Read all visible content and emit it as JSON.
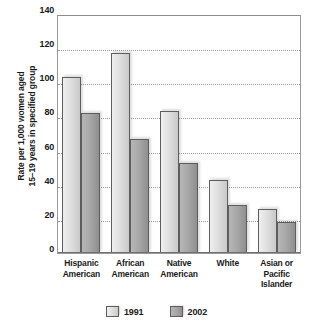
{
  "chart_data": {
    "type": "bar",
    "title": "",
    "xlabel": "",
    "ylabel": "Rate per 1,000 women aged 15–19 years in specified group",
    "ylabel_lines": [
      "Rate per 1,000 women aged",
      "15–19 years in specified group"
    ],
    "categories": [
      [
        "Hispanic",
        "American"
      ],
      [
        "African",
        "American"
      ],
      [
        "Native",
        "American"
      ],
      [
        "White"
      ],
      [
        "Asian or",
        "Pacific",
        "Islander"
      ]
    ],
    "category_names": [
      "Hispanic American",
      "African American",
      "Native American",
      "White",
      "Asian or Pacific Islander"
    ],
    "series": [
      {
        "name": "1991",
        "values": [
          103,
          117,
          83,
          43,
          26
        ],
        "color": "#e2e2e2"
      },
      {
        "name": "2002",
        "values": [
          82,
          67,
          53,
          28,
          18
        ],
        "color": "#a8a8a8"
      }
    ],
    "ylim": [
      0,
      140
    ],
    "ytick_values": [
      0,
      20,
      40,
      60,
      80,
      100,
      120,
      140
    ],
    "ytick_labels": [
      "0",
      "20",
      "40",
      "60",
      "80",
      "100",
      "120",
      "140"
    ],
    "grid": true,
    "grid_style": "dotted-horizontal",
    "legend_position": "bottom-center"
  },
  "legend": {
    "items": [
      {
        "label": "1991",
        "series_class": "series-1991"
      },
      {
        "label": "2002",
        "series_class": "series-2002"
      }
    ]
  }
}
